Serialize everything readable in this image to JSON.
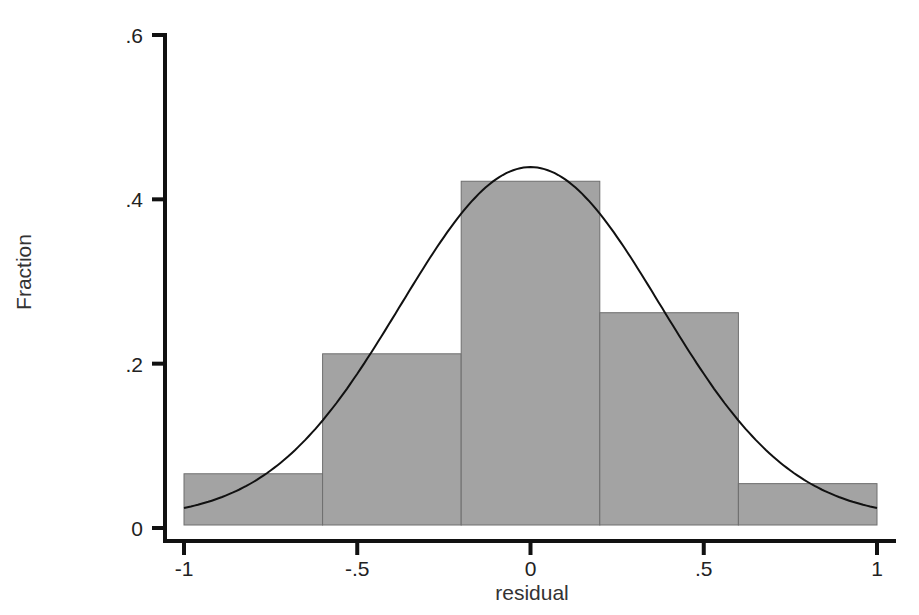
{
  "chart_data": {
    "type": "bar",
    "subtype": "histogram_with_normal_density",
    "title": "",
    "xlabel": "residual",
    "ylabel": "Fraction",
    "bin_edges": [
      -1,
      -0.6,
      -0.2,
      0.2,
      0.6,
      1
    ],
    "categories": [
      "[-1,-0.6)",
      "[-0.6,-0.2)",
      "[-0.2,0.2)",
      "[0.2,0.6)",
      "[0.6,1]"
    ],
    "values": [
      0.066,
      0.212,
      0.422,
      0.262,
      0.054
    ],
    "overlay": {
      "type": "normal_curve",
      "mean": 0.0,
      "sd": 0.375,
      "peak": 0.427
    },
    "xlim": [
      -1,
      1
    ],
    "ylim": [
      0,
      0.6
    ],
    "xticks": [
      -1,
      -0.5,
      0,
      0.5,
      1
    ],
    "xtick_labels": [
      "-1",
      "-.5",
      "0",
      ".5",
      "1"
    ],
    "yticks": [
      0,
      0.2,
      0.4,
      0.6
    ],
    "ytick_labels": [
      "0",
      ".2",
      ".4",
      ".6"
    ],
    "grid": false,
    "legend": null,
    "colors": {
      "bar_fill": "#a3a3a3",
      "bar_stroke": "#6e6e6e",
      "curve": "#111111",
      "axis": "#111111"
    }
  }
}
